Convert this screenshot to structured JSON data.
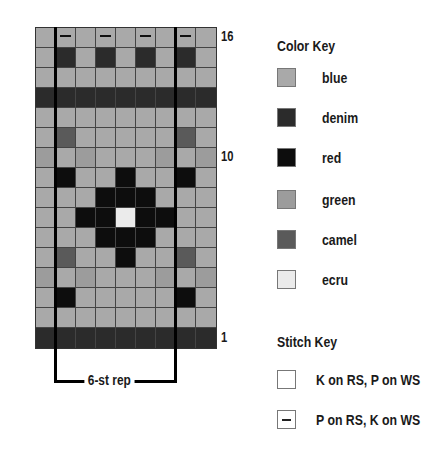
{
  "chart_data": {
    "type": "knitting-chart",
    "columns": 9,
    "rows": 16,
    "row_labels": [
      {
        "row": 16,
        "label": "16"
      },
      {
        "row": 10,
        "label": "10"
      },
      {
        "row": 1,
        "label": "1"
      }
    ],
    "repeat_label": "6-st rep",
    "repeat_columns": [
      2,
      7
    ],
    "grid_top_to_bottom": [
      [
        "blue",
        "blue",
        "blue",
        "blue",
        "blue",
        "blue",
        "blue",
        "blue",
        "blue"
      ],
      [
        "blue",
        "denim",
        "blue",
        "denim",
        "blue",
        "denim",
        "blue",
        "denim",
        "blue"
      ],
      [
        "blue",
        "blue",
        "blue",
        "blue",
        "blue",
        "blue",
        "blue",
        "blue",
        "blue"
      ],
      [
        "denim",
        "denim",
        "denim",
        "denim",
        "denim",
        "denim",
        "denim",
        "denim",
        "denim"
      ],
      [
        "blue",
        "blue",
        "blue",
        "blue",
        "blue",
        "blue",
        "blue",
        "blue",
        "blue"
      ],
      [
        "blue",
        "camel",
        "blue",
        "blue",
        "blue",
        "blue",
        "blue",
        "camel",
        "blue"
      ],
      [
        "green",
        "blue",
        "green",
        "blue",
        "blue",
        "blue",
        "green",
        "blue",
        "green"
      ],
      [
        "blue",
        "red",
        "blue",
        "blue",
        "red",
        "blue",
        "blue",
        "red",
        "blue"
      ],
      [
        "blue",
        "blue",
        "blue",
        "red",
        "red",
        "red",
        "blue",
        "blue",
        "blue"
      ],
      [
        "blue",
        "blue",
        "red",
        "red",
        "ecru",
        "red",
        "red",
        "blue",
        "blue"
      ],
      [
        "blue",
        "blue",
        "blue",
        "red",
        "red",
        "red",
        "blue",
        "blue",
        "blue"
      ],
      [
        "blue",
        "camel",
        "blue",
        "blue",
        "red",
        "blue",
        "blue",
        "camel",
        "blue"
      ],
      [
        "green",
        "blue",
        "green",
        "blue",
        "blue",
        "blue",
        "green",
        "blue",
        "green"
      ],
      [
        "blue",
        "red",
        "blue",
        "blue",
        "blue",
        "blue",
        "blue",
        "red",
        "blue"
      ],
      [
        "blue",
        "blue",
        "blue",
        "blue",
        "blue",
        "blue",
        "blue",
        "blue",
        "blue"
      ],
      [
        "denim",
        "denim",
        "denim",
        "denim",
        "denim",
        "denim",
        "denim",
        "denim",
        "denim"
      ]
    ],
    "purl_marks_top_to_bottom": [
      [
        false,
        true,
        false,
        true,
        false,
        true,
        false,
        true,
        false
      ],
      [
        false,
        false,
        false,
        false,
        false,
        false,
        false,
        false,
        false
      ],
      [
        false,
        false,
        false,
        false,
        false,
        false,
        false,
        false,
        false
      ],
      [
        false,
        false,
        false,
        false,
        false,
        false,
        false,
        false,
        false
      ],
      [
        false,
        false,
        false,
        false,
        false,
        false,
        false,
        false,
        false
      ],
      [
        false,
        false,
        false,
        false,
        false,
        false,
        false,
        false,
        false
      ],
      [
        false,
        false,
        false,
        false,
        false,
        false,
        false,
        false,
        false
      ],
      [
        false,
        false,
        false,
        false,
        false,
        false,
        false,
        false,
        false
      ],
      [
        false,
        false,
        false,
        false,
        false,
        false,
        false,
        false,
        false
      ],
      [
        false,
        false,
        false,
        false,
        false,
        false,
        false,
        false,
        false
      ],
      [
        false,
        false,
        false,
        false,
        false,
        false,
        false,
        false,
        false
      ],
      [
        false,
        false,
        false,
        false,
        false,
        false,
        false,
        false,
        false
      ],
      [
        false,
        false,
        false,
        false,
        false,
        false,
        false,
        false,
        false
      ],
      [
        false,
        false,
        false,
        false,
        false,
        false,
        false,
        false,
        false
      ],
      [
        false,
        false,
        false,
        false,
        false,
        false,
        false,
        false,
        false
      ],
      [
        false,
        false,
        false,
        false,
        false,
        false,
        false,
        false,
        false
      ]
    ]
  },
  "colors": {
    "blue": "#a9a9a9",
    "denim": "#2b2b2b",
    "red": "#0d0d0d",
    "green": "#9c9c9c",
    "camel": "#5a5a5a",
    "ecru": "#ebebeb"
  },
  "color_key": {
    "title": "Color Key",
    "items": [
      {
        "name": "blue",
        "label": "blue"
      },
      {
        "name": "denim",
        "label": "denim"
      },
      {
        "name": "red",
        "label": "red"
      },
      {
        "name": "green",
        "label": "green"
      },
      {
        "name": "camel",
        "label": "camel"
      },
      {
        "name": "ecru",
        "label": "ecru"
      }
    ]
  },
  "stitch_key": {
    "title": "Stitch Key",
    "items": [
      {
        "symbol": "blank",
        "label": "K on RS, P on WS"
      },
      {
        "symbol": "dash",
        "label": "P on RS, K on WS"
      }
    ]
  },
  "labels": {
    "row_16": "16",
    "row_10": "10",
    "row_1": "1",
    "repeat": "6-st rep"
  }
}
